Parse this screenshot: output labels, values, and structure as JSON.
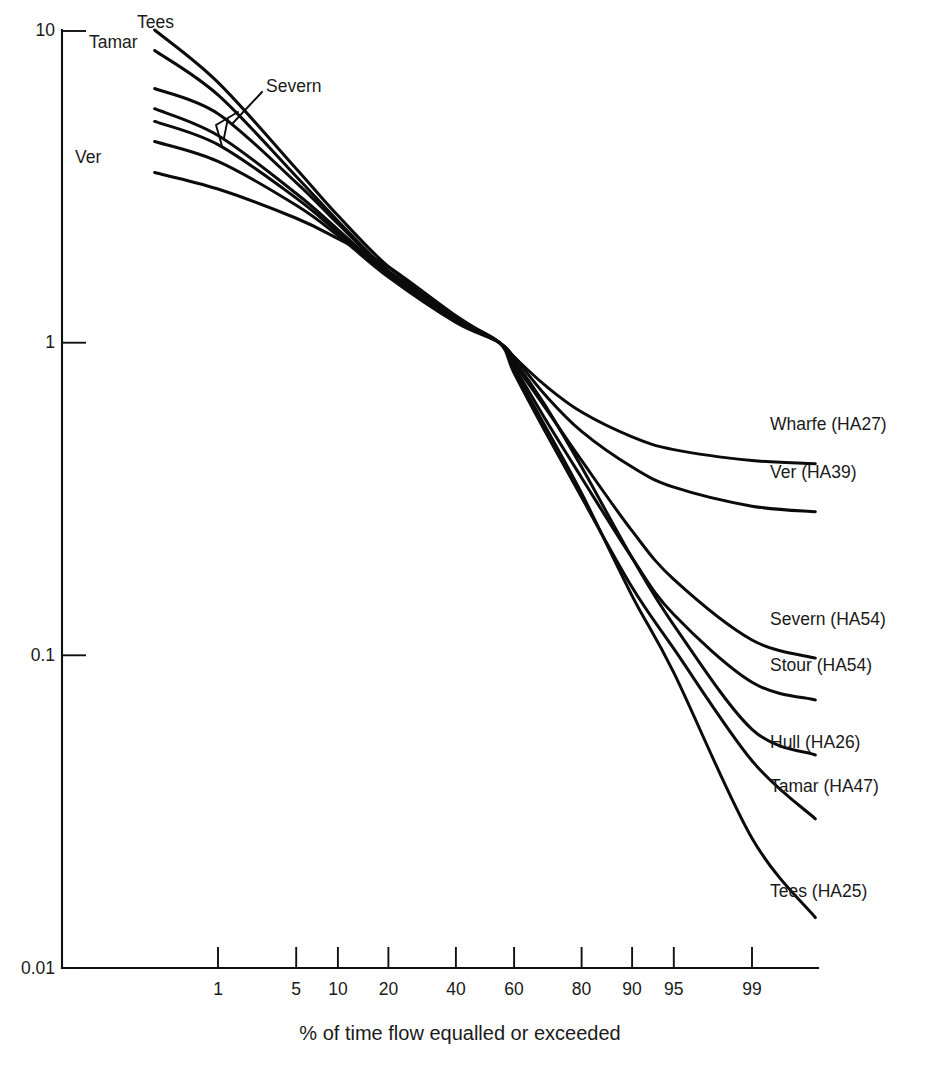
{
  "chart_data": {
    "type": "line",
    "title": "",
    "xlabel": "% of time flow equalled or exceeded",
    "ylabel": "",
    "xscale": "normal-probability",
    "yscale": "log",
    "ylim": [
      0.01,
      10
    ],
    "xlim": [
      0.1,
      99.9
    ],
    "grid": false,
    "legend": "inline-curve-labels",
    "ytick_labels": [
      "10",
      "1",
      "0.1",
      "0.01"
    ],
    "ytick_values": [
      10,
      1,
      0.1,
      0.01
    ],
    "xtick_labels": [
      "1",
      "5",
      "10",
      "20",
      "40",
      "60",
      "80",
      "90",
      "95",
      "99"
    ],
    "xtick_values": [
      1,
      5,
      10,
      20,
      40,
      60,
      80,
      90,
      95,
      99
    ],
    "series": [
      {
        "name": "Tees (HA25)",
        "left_label": "Tees",
        "right_label": "Tees (HA25)",
        "x": [
          0.2,
          1,
          5,
          10,
          20,
          40,
          55,
          60,
          70,
          80,
          90,
          95,
          99,
          99.8
        ],
        "y": [
          10.0,
          6.8,
          3.6,
          2.55,
          1.75,
          1.2,
          1.0,
          0.82,
          0.54,
          0.33,
          0.155,
          0.088,
          0.026,
          0.0145
        ]
      },
      {
        "name": "Tamar (HA47)",
        "left_label": "Tamar",
        "right_label": "Tamar (HA47)",
        "x": [
          0.2,
          1,
          5,
          10,
          20,
          40,
          55,
          60,
          70,
          80,
          90,
          95,
          99,
          99.8
        ],
        "y": [
          8.6,
          6.2,
          3.4,
          2.45,
          1.7,
          1.2,
          1.0,
          0.8,
          0.52,
          0.32,
          0.165,
          0.105,
          0.046,
          0.03
        ]
      },
      {
        "name": "Severn (HA54)",
        "left_label": "Severn",
        "right_label": "Severn (HA54)",
        "x": [
          0.2,
          1,
          5,
          10,
          20,
          40,
          55,
          60,
          70,
          80,
          90,
          95,
          99,
          99.8
        ],
        "y": [
          5.1,
          4.3,
          2.9,
          2.25,
          1.65,
          1.18,
          1.0,
          0.86,
          0.62,
          0.42,
          0.25,
          0.175,
          0.112,
          0.098
        ]
      },
      {
        "name": "Stour (HA54)",
        "right_label": "Stour (HA54)",
        "x": [
          0.2,
          1,
          5,
          10,
          20,
          40,
          55,
          60,
          70,
          80,
          90,
          95,
          99,
          99.8
        ],
        "y": [
          5.6,
          4.6,
          3.0,
          2.3,
          1.66,
          1.18,
          1.0,
          0.84,
          0.57,
          0.37,
          0.205,
          0.135,
          0.082,
          0.072
        ]
      },
      {
        "name": "Hull (HA26)",
        "right_label": "Hull (HA26)",
        "x": [
          0.2,
          1,
          5,
          10,
          20,
          40,
          55,
          60,
          70,
          80,
          90,
          95,
          99,
          99.8
        ],
        "y": [
          4.4,
          3.8,
          2.75,
          2.2,
          1.62,
          1.16,
          1.0,
          0.88,
          0.63,
          0.4,
          0.205,
          0.125,
          0.058,
          0.048
        ]
      },
      {
        "name": "Wharfe (HA27)",
        "right_label": "Wharfe (HA27)",
        "x": [
          0.2,
          1,
          5,
          10,
          20,
          40,
          55,
          60,
          70,
          80,
          90,
          95,
          99,
          99.8
        ],
        "y": [
          6.5,
          5.4,
          3.25,
          2.4,
          1.68,
          1.18,
          1.0,
          0.9,
          0.73,
          0.6,
          0.5,
          0.455,
          0.42,
          0.41
        ]
      },
      {
        "name": "Ver (HA39)",
        "left_label": "Ver",
        "right_label": "Ver (HA39)",
        "x": [
          0.2,
          1,
          5,
          10,
          20,
          40,
          55,
          60,
          70,
          80,
          90,
          95,
          99,
          99.8
        ],
        "y": [
          3.5,
          3.1,
          2.5,
          2.15,
          1.75,
          1.22,
          1.0,
          0.9,
          0.68,
          0.52,
          0.4,
          0.345,
          0.3,
          0.288
        ]
      }
    ],
    "annotations": [
      {
        "text": "Tees",
        "kind": "left-label"
      },
      {
        "text": "Tamar",
        "kind": "left-label"
      },
      {
        "text": "Severn",
        "kind": "left-label-with-leader"
      },
      {
        "text": "Ver",
        "kind": "left-label"
      }
    ]
  },
  "axis": {
    "y_labels": [
      "10",
      "1",
      "0.1",
      "0.01"
    ],
    "x_labels": [
      "1",
      "5",
      "10",
      "20",
      "40",
      "60",
      "80",
      "90",
      "95",
      "99"
    ],
    "x_title": "% of time flow equalled or exceeded"
  },
  "labels": {
    "left": {
      "tees": "Tees",
      "tamar": "Tamar",
      "severn": "Severn",
      "ver": "Ver"
    },
    "right": {
      "wharfe": "Wharfe (HA27)",
      "ver": "Ver (HA39)",
      "severn": "Severn (HA54)",
      "stour": "Stour (HA54)",
      "hull": "Hull (HA26)",
      "tamar": "Tamar (HA47)",
      "tees": "Tees (HA25)"
    }
  },
  "colors": {
    "curve": "#0b0b0b",
    "axis": "#101010",
    "text": "#1a1a1a",
    "background": "#ffffff"
  }
}
